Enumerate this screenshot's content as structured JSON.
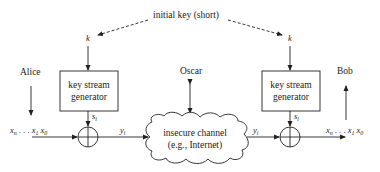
{
  "diagram": {
    "title_label": "initial key (short)",
    "key_symbol": "k",
    "left": {
      "party": "Alice",
      "generator_line1": "key stream",
      "generator_line2": "generator",
      "keystream_symbol": "s",
      "keystream_sub": "i",
      "plaintext_x": "x",
      "plaintext_n": "n",
      "plaintext_dots": " . . . ",
      "plaintext_1": "1",
      "plaintext_0": "0",
      "cipher_symbol": "y",
      "cipher_sub": "i"
    },
    "channel": {
      "line1": "insecure channel",
      "line2": "(e.g., Internet)",
      "attacker": "Oscar"
    },
    "right": {
      "party": "Bob",
      "generator_line1": "key stream",
      "generator_line2": "generator",
      "keystream_symbol": "s",
      "keystream_sub": "i",
      "cipher_symbol": "y",
      "cipher_sub": "i",
      "plaintext_x": "x",
      "plaintext_n": "n",
      "plaintext_dots": " . . . ",
      "plaintext_1": "1",
      "plaintext_0": "0"
    },
    "colors": {
      "stroke": "#222222",
      "text": "#222222",
      "background": "#ffffff"
    }
  }
}
